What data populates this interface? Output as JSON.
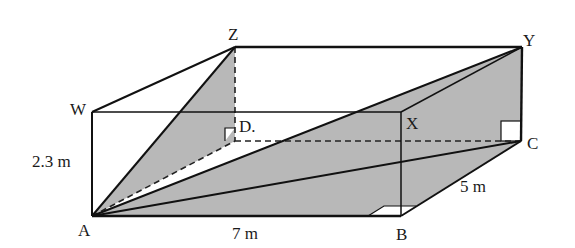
{
  "diagram": {
    "type": "rectangular-prism",
    "vertices": {
      "A": {
        "label": "A",
        "x": 92,
        "y": 216
      },
      "B": {
        "label": "B",
        "x": 401,
        "y": 216
      },
      "C": {
        "label": "C",
        "x": 521,
        "y": 141
      },
      "D": {
        "label": "D.",
        "x": 235,
        "y": 141
      },
      "W": {
        "label": "W",
        "x": 92,
        "y": 112
      },
      "X": {
        "label": "X",
        "x": 401,
        "y": 112
      },
      "Y": {
        "label": "Y",
        "x": 522,
        "y": 47
      },
      "Z": {
        "label": "Z",
        "x": 235,
        "y": 47
      }
    },
    "dimensions": {
      "height": "2.3 m",
      "length": "7 m",
      "width": "5 m"
    },
    "shaded_regions": [
      [
        "A",
        "Z",
        "D"
      ],
      [
        "A",
        "Y",
        "C",
        "B"
      ]
    ],
    "colors": {
      "edge": "#111111",
      "shade": "#b8b8b8",
      "background": "#ffffff"
    }
  }
}
